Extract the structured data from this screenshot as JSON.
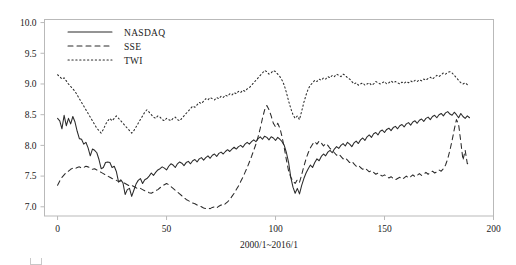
{
  "chart_data": {
    "type": "line",
    "title": "",
    "xlabel": "2000/1~2016/1",
    "ylabel": "",
    "xlim": [
      -6,
      200
    ],
    "ylim": [
      6.85,
      10.05
    ],
    "xticks": [
      0,
      50,
      100,
      150,
      200
    ],
    "yticks": [
      7.0,
      7.5,
      8.0,
      8.5,
      9.0,
      9.5,
      10.0
    ],
    "xtick_labels": [
      "0",
      "50",
      "100",
      "150",
      "200"
    ],
    "ytick_labels": [
      "7.0",
      "7.5",
      "8.0",
      "8.5",
      "9.0",
      "9.5",
      "10.0"
    ],
    "grid": false,
    "legend_position": "upper-left-inside",
    "legend": [
      {
        "name": "NASDAQ",
        "style": "solid"
      },
      {
        "name": "SSE",
        "style": "dashed"
      },
      {
        "name": "TWI",
        "style": "dotted"
      }
    ],
    "series": [
      {
        "name": "NASDAQ",
        "style": "solid",
        "values": [
          8.44,
          8.4,
          8.27,
          8.49,
          8.32,
          8.44,
          8.35,
          8.47,
          8.38,
          8.23,
          8.11,
          8.1,
          8.02,
          8.05,
          7.96,
          7.83,
          7.94,
          7.92,
          7.88,
          7.77,
          7.62,
          7.64,
          7.72,
          7.73,
          7.72,
          7.64,
          7.66,
          7.57,
          7.4,
          7.44,
          7.39,
          7.2,
          7.28,
          7.3,
          7.17,
          7.27,
          7.37,
          7.43,
          7.46,
          7.38,
          7.44,
          7.46,
          7.5,
          7.55,
          7.51,
          7.56,
          7.6,
          7.62,
          7.65,
          7.63,
          7.6,
          7.66,
          7.7,
          7.68,
          7.64,
          7.7,
          7.73,
          7.71,
          7.67,
          7.72,
          7.74,
          7.7,
          7.75,
          7.77,
          7.73,
          7.78,
          7.8,
          7.76,
          7.8,
          7.83,
          7.79,
          7.84,
          7.86,
          7.82,
          7.87,
          7.89,
          7.86,
          7.9,
          7.93,
          7.9,
          7.94,
          7.97,
          7.94,
          7.98,
          8.0,
          7.97,
          8.02,
          8.05,
          8.02,
          8.06,
          8.09,
          8.06,
          8.11,
          8.14,
          8.1,
          8.15,
          8.13,
          8.09,
          8.14,
          8.12,
          8.08,
          8.13,
          8.1,
          8.06,
          8.0,
          7.88,
          7.72,
          7.48,
          7.32,
          7.22,
          7.3,
          7.21,
          7.35,
          7.46,
          7.55,
          7.62,
          7.68,
          7.64,
          7.72,
          7.78,
          7.75,
          7.82,
          7.86,
          7.83,
          7.89,
          7.92,
          7.88,
          7.94,
          7.98,
          7.95,
          8.0,
          8.03,
          7.99,
          8.05,
          8.02,
          7.98,
          8.04,
          8.07,
          8.03,
          8.09,
          8.12,
          8.08,
          8.14,
          8.17,
          8.13,
          8.19,
          8.21,
          8.17,
          8.23,
          8.25,
          8.21,
          8.26,
          8.28,
          8.24,
          8.29,
          8.31,
          8.27,
          8.32,
          8.34,
          8.3,
          8.35,
          8.37,
          8.33,
          8.38,
          8.4,
          8.36,
          8.41,
          8.43,
          8.39,
          8.44,
          8.46,
          8.42,
          8.47,
          8.49,
          8.45,
          8.5,
          8.52,
          8.48,
          8.53,
          8.55,
          8.51,
          8.49,
          8.54,
          8.5,
          8.45,
          8.52,
          8.47,
          8.44,
          8.48,
          8.45
        ]
      },
      {
        "name": "SSE",
        "style": "dashed",
        "values": [
          7.35,
          7.42,
          7.48,
          7.52,
          7.56,
          7.58,
          7.61,
          7.63,
          7.62,
          7.64,
          7.65,
          7.63,
          7.64,
          7.66,
          7.65,
          7.63,
          7.61,
          7.62,
          7.6,
          7.58,
          7.56,
          7.54,
          7.52,
          7.5,
          7.48,
          7.46,
          7.45,
          7.43,
          7.41,
          7.42,
          7.4,
          7.38,
          7.36,
          7.34,
          7.35,
          7.33,
          7.31,
          7.29,
          7.3,
          7.28,
          7.26,
          7.25,
          7.23,
          7.22,
          7.24,
          7.26,
          7.28,
          7.31,
          7.34,
          7.36,
          7.38,
          7.36,
          7.33,
          7.3,
          7.27,
          7.24,
          7.21,
          7.18,
          7.15,
          7.12,
          7.1,
          7.08,
          7.06,
          7.05,
          7.03,
          7.02,
          7.0,
          6.98,
          6.97,
          6.98,
          6.97,
          6.99,
          7.0,
          6.98,
          7.01,
          7.03,
          7.02,
          7.05,
          7.08,
          7.12,
          7.17,
          7.22,
          7.28,
          7.34,
          7.41,
          7.48,
          7.56,
          7.64,
          7.73,
          7.82,
          7.92,
          8.02,
          8.14,
          8.28,
          8.44,
          8.58,
          8.65,
          8.58,
          8.48,
          8.36,
          8.3,
          8.36,
          8.28,
          8.14,
          7.96,
          7.76,
          7.58,
          7.48,
          7.42,
          7.38,
          7.44,
          7.4,
          7.52,
          7.66,
          7.78,
          7.88,
          7.96,
          8.02,
          8.06,
          8.02,
          8.07,
          8.04,
          7.99,
          8.03,
          8.0,
          7.95,
          7.92,
          7.88,
          7.84,
          7.86,
          7.82,
          7.78,
          7.8,
          7.76,
          7.72,
          7.74,
          7.7,
          7.66,
          7.68,
          7.64,
          7.61,
          7.63,
          7.6,
          7.57,
          7.59,
          7.56,
          7.53,
          7.55,
          7.52,
          7.5,
          7.52,
          7.49,
          7.47,
          7.49,
          7.46,
          7.44,
          7.46,
          7.48,
          7.45,
          7.47,
          7.5,
          7.47,
          7.49,
          7.52,
          7.49,
          7.51,
          7.54,
          7.51,
          7.53,
          7.56,
          7.53,
          7.55,
          7.58,
          7.55,
          7.57,
          7.6,
          7.58,
          7.62,
          7.68,
          7.78,
          7.92,
          8.08,
          8.26,
          8.42,
          8.34,
          8.06,
          7.76,
          7.92,
          7.7,
          7.74
        ]
      },
      {
        "name": "TWI",
        "style": "dotted",
        "values": [
          9.15,
          9.12,
          9.08,
          9.1,
          9.05,
          9.0,
          8.96,
          8.92,
          8.88,
          8.82,
          8.76,
          8.7,
          8.64,
          8.58,
          8.52,
          8.46,
          8.4,
          8.34,
          8.28,
          8.24,
          8.2,
          8.26,
          8.34,
          8.4,
          8.44,
          8.4,
          8.44,
          8.48,
          8.44,
          8.4,
          8.36,
          8.32,
          8.28,
          8.24,
          8.2,
          8.24,
          8.3,
          8.36,
          8.42,
          8.48,
          8.54,
          8.58,
          8.54,
          8.5,
          8.46,
          8.44,
          8.48,
          8.46,
          8.42,
          8.4,
          8.44,
          8.42,
          8.4,
          8.44,
          8.46,
          8.42,
          8.4,
          8.44,
          8.48,
          8.52,
          8.56,
          8.6,
          8.64,
          8.62,
          8.66,
          8.7,
          8.68,
          8.72,
          8.76,
          8.74,
          8.78,
          8.76,
          8.74,
          8.78,
          8.76,
          8.8,
          8.78,
          8.82,
          8.8,
          8.84,
          8.82,
          8.86,
          8.84,
          8.88,
          8.86,
          8.9,
          8.88,
          8.92,
          8.94,
          8.98,
          9.02,
          9.06,
          9.1,
          9.14,
          9.18,
          9.22,
          9.2,
          9.16,
          9.18,
          9.22,
          9.2,
          9.16,
          9.12,
          9.06,
          8.98,
          8.86,
          8.72,
          8.6,
          8.5,
          8.44,
          8.48,
          8.42,
          8.56,
          8.7,
          8.82,
          8.92,
          8.98,
          9.02,
          9.06,
          9.04,
          9.08,
          9.06,
          9.1,
          9.08,
          9.12,
          9.1,
          9.14,
          9.12,
          9.16,
          9.14,
          9.12,
          9.16,
          9.14,
          9.1,
          9.08,
          9.04,
          9.0,
          9.02,
          8.98,
          9.0,
          9.02,
          8.98,
          9.0,
          9.02,
          8.98,
          9.0,
          9.04,
          9.02,
          9.0,
          9.02,
          9.04,
          9.0,
          9.02,
          9.05,
          9.02,
          9.04,
          9.02,
          9.0,
          9.03,
          9.01,
          9.04,
          9.02,
          9.05,
          9.03,
          9.06,
          9.04,
          9.07,
          9.05,
          9.08,
          9.06,
          9.09,
          9.11,
          9.08,
          9.11,
          9.14,
          9.12,
          9.15,
          9.18,
          9.16,
          9.19,
          9.2,
          9.18,
          9.14,
          9.1,
          9.06,
          9.02,
          9.0,
          9.02,
          8.99,
          9.0
        ]
      }
    ]
  },
  "footer": {
    "note": ""
  }
}
